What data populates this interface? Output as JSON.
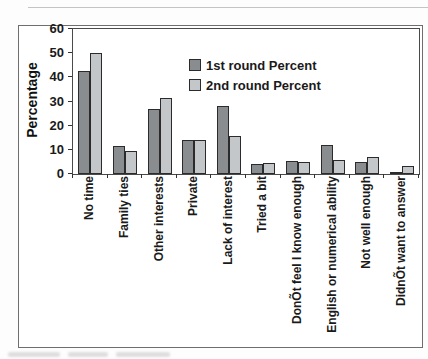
{
  "chart_data": {
    "type": "bar",
    "title": "",
    "xlabel": "",
    "ylabel": "Percentage",
    "ylim": [
      0,
      60
    ],
    "yticks": [
      0,
      10,
      20,
      30,
      40,
      50,
      60
    ],
    "grid": false,
    "legend_position": "upper-right-inside",
    "categories": [
      "No time",
      "Family ties",
      "Other interests",
      "Private",
      "Lack of interest",
      "Tried a bit",
      "DonÕt feel I know enough",
      "English or numerical ability",
      "Not well enough",
      "DidnÕt want to answer"
    ],
    "series": [
      {
        "name": "1st round Percent",
        "color": "#8a8d8f",
        "values": [
          42.5,
          11.4,
          27,
          14,
          28,
          4,
          5.2,
          12,
          4.8,
          1
        ]
      },
      {
        "name": "2nd round Percent",
        "color": "#c3c7c9",
        "values": [
          50,
          9.4,
          31.5,
          14,
          15.7,
          4.7,
          4.9,
          5.9,
          7,
          3.2
        ]
      }
    ],
    "bar_stroke": "#2b2b2b",
    "frame_color": "#6e6e6e"
  }
}
